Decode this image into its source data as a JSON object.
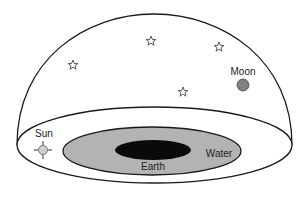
{
  "diagram": {
    "type": "ancient-cosmology-dome",
    "labels": {
      "sun": "Sun",
      "moon": "Moon",
      "earth": "Earth",
      "water": "Water"
    },
    "stars": [
      {
        "x": 151,
        "y": 41
      },
      {
        "x": 219,
        "y": 47
      },
      {
        "x": 73,
        "y": 65
      },
      {
        "x": 183,
        "y": 92
      }
    ],
    "colors": {
      "outline": "#1a1a1a",
      "sky": "#ffffff",
      "water": "#b3b3b3",
      "earth": "#0a0a0a",
      "moon": "#808080",
      "sun": "#cfcfcf"
    }
  }
}
